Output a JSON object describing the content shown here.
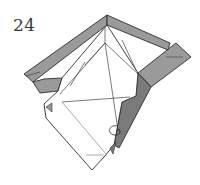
{
  "diagram": {
    "type": "origami-folding-step",
    "step_number": "24",
    "colors": {
      "paper_white": "#ffffff",
      "paper_colored": "#9a9a9a",
      "paper_colored_dark": "#7a7a7a",
      "outline": "#2e2e2e",
      "crease": "#555555"
    },
    "symbols": [
      {
        "name": "return-arrow",
        "description": "curled arrow near lower right of white face"
      }
    ]
  }
}
